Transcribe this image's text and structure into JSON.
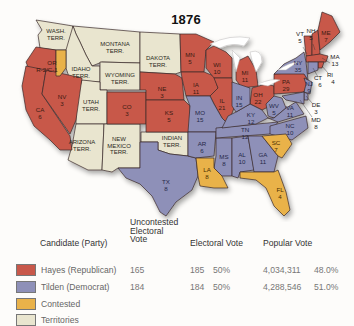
{
  "title": "1876",
  "colors": {
    "republican": "#c8584a",
    "democrat": "#8e90b8",
    "contested": "#e9b24a",
    "territory": "#e9e5cf",
    "lakes": "#ffffff"
  },
  "territories": {
    "wa": {
      "l1": "WASH.",
      "l2": "TERR."
    },
    "mt": {
      "l1": "MONTANA",
      "l2": "TERR."
    },
    "id": {
      "l1": "IDAHO",
      "l2": "TERR."
    },
    "wy": {
      "l1": "WYOMING",
      "l2": "TERR."
    },
    "dk": {
      "l1": "DAKOTA",
      "l2": "TERR."
    },
    "ut": {
      "l1": "UTAH",
      "l2": "TERR."
    },
    "az": {
      "l1": "ARIZONA",
      "l2": "TERR."
    },
    "nm": {
      "l1": "NEW",
      "l2": "MEXICO",
      "l3": "TERR."
    },
    "it": {
      "l1": "INDIAN",
      "l2": "TERR."
    }
  },
  "states": {
    "or": {
      "abbr": "OR",
      "votes": "R-2/C-1",
      "party": "republican"
    },
    "ca": {
      "abbr": "CA",
      "votes": "6",
      "party": "republican"
    },
    "nv": {
      "abbr": "NV",
      "votes": "3",
      "party": "republican"
    },
    "co": {
      "abbr": "CO",
      "votes": "3",
      "party": "republican"
    },
    "ne": {
      "abbr": "NE",
      "votes": "3",
      "party": "republican"
    },
    "ks": {
      "abbr": "KS",
      "votes": "5",
      "party": "republican"
    },
    "mn": {
      "abbr": "MN",
      "votes": "5",
      "party": "republican"
    },
    "ia": {
      "abbr": "IA",
      "votes": "11",
      "party": "republican"
    },
    "wi": {
      "abbr": "WI",
      "votes": "10",
      "party": "republican"
    },
    "il": {
      "abbr": "IL",
      "votes": "21",
      "party": "republican"
    },
    "mi": {
      "abbr": "MI",
      "votes": "11",
      "party": "republican"
    },
    "oh": {
      "abbr": "OH",
      "votes": "22",
      "party": "republican"
    },
    "pa": {
      "abbr": "PA",
      "votes": "29",
      "party": "republican"
    },
    "vt": {
      "abbr": "VT",
      "votes": "5",
      "party": "republican"
    },
    "nh": {
      "abbr": "NH",
      "votes": "5",
      "party": "republican"
    },
    "me": {
      "abbr": "ME",
      "votes": "7",
      "party": "republican"
    },
    "ma": {
      "abbr": "MA",
      "votes": "13",
      "party": "republican"
    },
    "ri": {
      "abbr": "RI",
      "votes": "4",
      "party": "republican"
    },
    "tx": {
      "abbr": "TX",
      "votes": "8",
      "party": "democrat"
    },
    "mo": {
      "abbr": "MO",
      "votes": "15",
      "party": "democrat"
    },
    "ar": {
      "abbr": "AR",
      "votes": "6",
      "party": "democrat"
    },
    "ms": {
      "abbr": "MS",
      "votes": "8",
      "party": "democrat"
    },
    "al": {
      "abbr": "AL",
      "votes": "10",
      "party": "democrat"
    },
    "ga": {
      "abbr": "GA",
      "votes": "11",
      "party": "democrat"
    },
    "tn": {
      "abbr": "TN",
      "votes": "12",
      "party": "democrat"
    },
    "ky": {
      "abbr": "KY",
      "votes": "12",
      "party": "democrat"
    },
    "in": {
      "abbr": "IN",
      "votes": "15",
      "party": "democrat"
    },
    "wv": {
      "abbr": "WV",
      "votes": "5",
      "party": "democrat"
    },
    "va": {
      "abbr": "VA",
      "votes": "11",
      "party": "democrat"
    },
    "nc": {
      "abbr": "NC",
      "votes": "10",
      "party": "democrat"
    },
    "ny": {
      "abbr": "NY",
      "votes": "35",
      "party": "democrat"
    },
    "nj": {
      "abbr": "NJ",
      "votes": "9",
      "party": "democrat"
    },
    "ct": {
      "abbr": "CT",
      "votes": "6",
      "party": "democrat"
    },
    "de": {
      "abbr": "DE",
      "votes": "3",
      "party": "democrat"
    },
    "md": {
      "abbr": "MD",
      "votes": "8",
      "party": "democrat"
    },
    "la": {
      "abbr": "LA",
      "votes": "8",
      "party": "contested"
    },
    "sc": {
      "abbr": "SC",
      "votes": "7",
      "party": "contested"
    },
    "fl": {
      "abbr": "FL",
      "votes": "4",
      "party": "contested"
    }
  },
  "legend": {
    "headers": {
      "candidate": "Candidate (Party)",
      "uncontested_l1": "Uncontested",
      "uncontested_l2": "Electoral",
      "uncontested_l3": "Vote",
      "electoral": "Electoral Vote",
      "popular": "Popular Vote"
    },
    "rows": [
      {
        "label": "Hayes (Republican)",
        "uncontested": "165",
        "electoral": "185",
        "electoral_pct": "50%",
        "popular": "4,034,311",
        "popular_pct": "48.0%"
      },
      {
        "label": "Tilden (Democrat)",
        "uncontested": "184",
        "electoral": "184",
        "electoral_pct": "50%",
        "popular": "4,288,546",
        "popular_pct": "51.0%"
      },
      {
        "label": "Contested"
      },
      {
        "label": "Territories"
      }
    ]
  }
}
